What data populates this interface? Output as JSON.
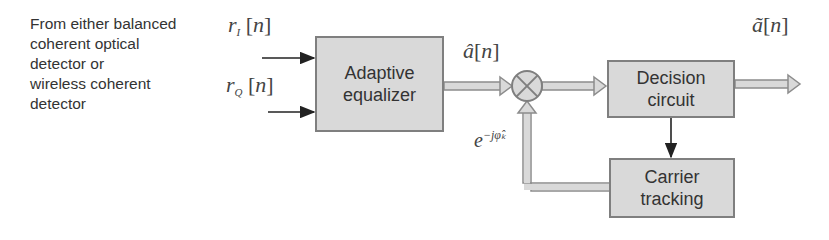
{
  "source_label": "From either balanced\ncoherent optical\ndetector or\nwireless coherent\ndetector",
  "inputs": {
    "rI": {
      "base": "r",
      "sub": "I",
      "arg": "n"
    },
    "rQ": {
      "base": "r",
      "sub": "Q",
      "arg": "n"
    }
  },
  "blocks": {
    "equalizer": "Adaptive\nequalizer",
    "decision": "Decision\ncircuit",
    "carrier": "Carrier\ntracking"
  },
  "signals": {
    "equalizer_out": {
      "base": "â",
      "arg": "n"
    },
    "decision_out": {
      "base": "ã",
      "arg": "n"
    },
    "phase_correction": {
      "base": "e",
      "exp": "−jφ̂ₖ"
    }
  },
  "colors": {
    "block_fill": "#d9d9d9",
    "block_border": "#7f7f7f",
    "arrow": "#8c8c8c",
    "text": "#333333"
  }
}
